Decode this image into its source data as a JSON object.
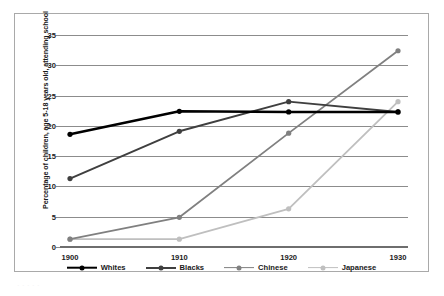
{
  "chart_data": {
    "type": "line",
    "title": "",
    "xlabel": "",
    "ylabel": "Percentage of children, age 5-18 years old, attending school",
    "x": [
      1900,
      1910,
      1920,
      1930
    ],
    "categories": [
      "1900",
      "1910",
      "1920",
      "1930"
    ],
    "xtick_labels": [
      "1900",
      "1910",
      "1920",
      "1930"
    ],
    "ytick_labels": [
      "0",
      "5",
      "10",
      "15",
      "20",
      "25",
      "30",
      "35"
    ],
    "ytick_values": [
      0,
      5,
      10,
      15,
      20,
      25,
      30,
      35
    ],
    "ylim": [
      0,
      35
    ],
    "grid": "horizontal",
    "legend_position": "bottom",
    "marker": "circle",
    "series": [
      {
        "name": "Whites",
        "values": [
          18.6,
          22.4,
          22.3,
          22.3
        ],
        "color": "#000000",
        "line_width": 2.6
      },
      {
        "name": "Blacks",
        "values": [
          11.3,
          19.1,
          24.0,
          22.3
        ],
        "color": "#3f3f3f",
        "line_width": 2.0
      },
      {
        "name": "Chinese",
        "values": [
          1.3,
          4.9,
          18.8,
          32.4
        ],
        "color": "#808080",
        "line_width": 1.8
      },
      {
        "name": "Japanese",
        "values": [
          1.3,
          1.3,
          6.3,
          24.0
        ],
        "color": "#bfbfbf",
        "line_width": 1.8
      }
    ]
  },
  "legend": {
    "items": [
      {
        "label": "Whites"
      },
      {
        "label": "Blacks"
      },
      {
        "label": "Chinese"
      },
      {
        "label": "Japanese"
      }
    ]
  },
  "caption_fragment": "· · · · ·"
}
